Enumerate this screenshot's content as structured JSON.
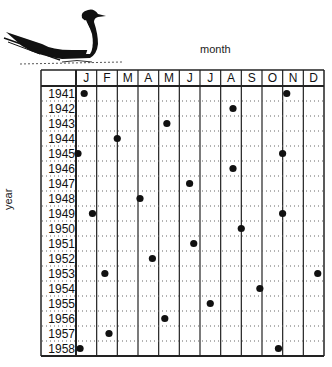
{
  "axis": {
    "x_label": "month",
    "y_label": "year"
  },
  "icons": {
    "bird": "sooty-tern-illustration"
  },
  "chart_data": {
    "type": "scatter",
    "title": "",
    "xlabel": "month",
    "ylabel": "year",
    "x_categories": [
      "J",
      "F",
      "M",
      "A",
      "M",
      "J",
      "J",
      "A",
      "S",
      "O",
      "N",
      "D"
    ],
    "y_categories": [
      "1941",
      "1942",
      "1943",
      "1944",
      "1945",
      "1946",
      "1947",
      "1948",
      "1949",
      "1950",
      "1951",
      "1952",
      "1953",
      "1954",
      "1955",
      "1956",
      "1957",
      "1958"
    ],
    "grid": {
      "vertical": "solid",
      "horizontal": "dotted"
    },
    "legend": "none",
    "x_unit": "months from start of January (0-12)",
    "points": [
      {
        "year": 1941,
        "month_pos": 0.3
      },
      {
        "year": 1941,
        "month_pos": 10.1
      },
      {
        "year": 1942,
        "month_pos": 7.5
      },
      {
        "year": 1943,
        "month_pos": 4.3
      },
      {
        "year": 1944,
        "month_pos": 1.9
      },
      {
        "year": 1945,
        "month_pos": 0.0
      },
      {
        "year": 1945,
        "month_pos": 9.9
      },
      {
        "year": 1946,
        "month_pos": 7.5
      },
      {
        "year": 1947,
        "month_pos": 5.4
      },
      {
        "year": 1948,
        "month_pos": 3.0
      },
      {
        "year": 1949,
        "month_pos": 0.7
      },
      {
        "year": 1949,
        "month_pos": 9.9
      },
      {
        "year": 1950,
        "month_pos": 7.9
      },
      {
        "year": 1951,
        "month_pos": 5.6
      },
      {
        "year": 1952,
        "month_pos": 3.6
      },
      {
        "year": 1953,
        "month_pos": 1.3
      },
      {
        "year": 1953,
        "month_pos": 11.6
      },
      {
        "year": 1954,
        "month_pos": 8.8
      },
      {
        "year": 1955,
        "month_pos": 6.4
      },
      {
        "year": 1956,
        "month_pos": 4.2
      },
      {
        "year": 1957,
        "month_pos": 1.5
      },
      {
        "year": 1958,
        "month_pos": 0.1
      },
      {
        "year": 1958,
        "month_pos": 9.7
      }
    ]
  }
}
